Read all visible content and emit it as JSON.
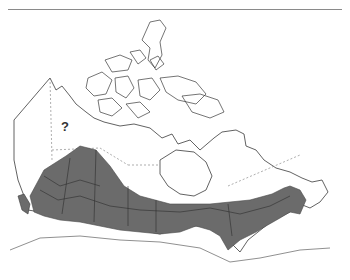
{
  "map": {
    "type": "range-map",
    "region": "Canada",
    "unknown_marker": "?",
    "colors": {
      "range_fill": "#6b6b6b",
      "outline": "#3a3a3a",
      "boundary": "#777777",
      "rule": "#8a8a8a",
      "background": "#ffffff"
    }
  }
}
